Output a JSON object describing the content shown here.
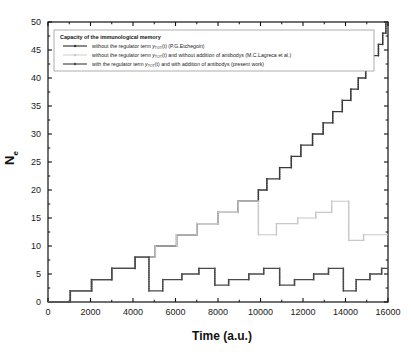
{
  "chart_data": {
    "type": "line",
    "title": "",
    "xlabel": "Time (a.u.)",
    "ylabel": "N e",
    "ylabel_main": "N",
    "ylabel_sub": "e",
    "xlim": [
      0,
      16000
    ],
    "ylim": [
      0,
      50
    ],
    "xticks": [
      0,
      2000,
      4000,
      6000,
      8000,
      10000,
      12000,
      14000,
      16000
    ],
    "yticks": [
      0,
      5,
      10,
      15,
      20,
      25,
      30,
      35,
      40,
      45,
      50
    ],
    "xtick_labels": [
      "0",
      "2000",
      "4000",
      "6000",
      "8000",
      "10000",
      "12000",
      "14000",
      "16000"
    ],
    "ytick_labels": [
      "0",
      "5",
      "10",
      "15",
      "20",
      "25",
      "30",
      "35",
      "40",
      "45",
      "50"
    ],
    "grid": false,
    "legend_position": "upper-left",
    "minor_ticks": true,
    "series": [
      {
        "name": "without the regulator term y_TOT(t) (P.G.Etchegoin)",
        "color": "#3a3a3a",
        "marker": "square",
        "steps": [
          [
            0,
            0
          ],
          [
            1050,
            0
          ],
          [
            1050,
            2
          ],
          [
            2050,
            2
          ],
          [
            2050,
            4
          ],
          [
            3000,
            4
          ],
          [
            3000,
            6
          ],
          [
            4100,
            6
          ],
          [
            4100,
            8
          ],
          [
            5050,
            8
          ],
          [
            5050,
            10
          ],
          [
            6050,
            10
          ],
          [
            6050,
            12
          ],
          [
            7000,
            12
          ],
          [
            7000,
            14
          ],
          [
            8000,
            14
          ],
          [
            8000,
            16
          ],
          [
            8950,
            16
          ],
          [
            8950,
            18
          ],
          [
            9900,
            18
          ],
          [
            9900,
            20
          ],
          [
            10300,
            20
          ],
          [
            10300,
            22
          ],
          [
            10900,
            22
          ],
          [
            10900,
            24
          ],
          [
            11450,
            24
          ],
          [
            11450,
            26
          ],
          [
            11900,
            26
          ],
          [
            11900,
            28
          ],
          [
            12450,
            28
          ],
          [
            12450,
            30
          ],
          [
            12950,
            30
          ],
          [
            12950,
            32
          ],
          [
            13400,
            32
          ],
          [
            13400,
            34
          ],
          [
            13850,
            34
          ],
          [
            13850,
            36
          ],
          [
            14250,
            36
          ],
          [
            14250,
            38
          ],
          [
            14600,
            38
          ],
          [
            14600,
            40
          ],
          [
            14950,
            40
          ],
          [
            14950,
            42
          ],
          [
            15300,
            42
          ],
          [
            15300,
            44
          ],
          [
            15550,
            44
          ],
          [
            15550,
            46
          ],
          [
            15750,
            46
          ],
          [
            15750,
            48
          ],
          [
            15900,
            48
          ],
          [
            15900,
            50
          ],
          [
            16000,
            50
          ]
        ]
      },
      {
        "name": "without the regulator term y_TOT(t) and without addition of antibodys (M.C.Lagreca et al.)",
        "color": "#c8c8c8",
        "marker": "square",
        "steps": [
          [
            0,
            0
          ],
          [
            1050,
            0
          ],
          [
            1050,
            2
          ],
          [
            2050,
            2
          ],
          [
            2050,
            4
          ],
          [
            3000,
            4
          ],
          [
            3000,
            6
          ],
          [
            4100,
            6
          ],
          [
            4100,
            8
          ],
          [
            5050,
            8
          ],
          [
            5050,
            10
          ],
          [
            6050,
            10
          ],
          [
            6050,
            12
          ],
          [
            7000,
            12
          ],
          [
            7000,
            14
          ],
          [
            8000,
            14
          ],
          [
            8000,
            16
          ],
          [
            8950,
            16
          ],
          [
            8950,
            18
          ],
          [
            9900,
            18
          ],
          [
            9900,
            12
          ],
          [
            10750,
            12
          ],
          [
            10750,
            14
          ],
          [
            11750,
            14
          ],
          [
            11750,
            15
          ],
          [
            12600,
            15
          ],
          [
            12600,
            16
          ],
          [
            13350,
            16
          ],
          [
            13350,
            18
          ],
          [
            14150,
            18
          ],
          [
            14150,
            11
          ],
          [
            14850,
            11
          ],
          [
            14850,
            12
          ],
          [
            16000,
            12
          ]
        ]
      },
      {
        "name": "with the regulator term y_TOT(t) and with addition of antibodys (present work)",
        "color": "#4a4a4a",
        "marker": "square",
        "steps": [
          [
            0,
            0
          ],
          [
            1050,
            0
          ],
          [
            1050,
            2
          ],
          [
            2050,
            2
          ],
          [
            2050,
            4
          ],
          [
            3000,
            4
          ],
          [
            3000,
            6
          ],
          [
            4100,
            6
          ],
          [
            4100,
            8
          ],
          [
            4750,
            8
          ],
          [
            4750,
            2
          ],
          [
            5400,
            2
          ],
          [
            5400,
            4
          ],
          [
            6300,
            4
          ],
          [
            6300,
            5
          ],
          [
            7100,
            5
          ],
          [
            7100,
            6
          ],
          [
            7850,
            6
          ],
          [
            7850,
            3
          ],
          [
            8500,
            3
          ],
          [
            8500,
            4
          ],
          [
            9450,
            4
          ],
          [
            9450,
            5
          ],
          [
            10150,
            5
          ],
          [
            10150,
            6
          ],
          [
            10900,
            6
          ],
          [
            10900,
            3
          ],
          [
            11600,
            3
          ],
          [
            11600,
            4
          ],
          [
            12500,
            4
          ],
          [
            12500,
            5
          ],
          [
            13200,
            5
          ],
          [
            13200,
            6
          ],
          [
            13900,
            6
          ],
          [
            13900,
            2
          ],
          [
            14500,
            2
          ],
          [
            14500,
            4
          ],
          [
            15150,
            4
          ],
          [
            15150,
            5
          ],
          [
            15700,
            5
          ],
          [
            15700,
            6
          ],
          [
            16000,
            6
          ]
        ]
      }
    ]
  },
  "axis": {
    "y_title_main": "N",
    "y_title_sub": "e",
    "x_title": "Time (a.u.)"
  },
  "legend": {
    "title": "Capacity of the immunological memory",
    "entries": [
      {
        "pre": "without the regulator term ",
        "sym_main": "y",
        "sym_sub": "TOT",
        "sym_arg": "(t)",
        "post": " (P.G.Etchegoin)",
        "color": "#3a3a3a",
        "marker": "square"
      },
      {
        "pre": "without the regulator term ",
        "sym_main": "y",
        "sym_sub": "TOT",
        "sym_arg": "(t)",
        "post": " and without addition of antibodys  (M.C.Lagreca et al.)",
        "color": "#c8c8c8",
        "marker": "square"
      },
      {
        "pre": "with the regulator term ",
        "sym_main": "y",
        "sym_sub": "TOT",
        "sym_arg": "(t)",
        "post": " and with addition of antibodys (present work)",
        "color": "#4a4a4a",
        "marker": "square"
      }
    ]
  }
}
